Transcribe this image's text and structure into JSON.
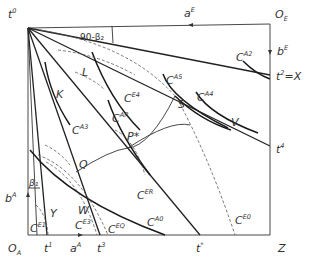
{
  "diagram": {
    "type": "edgeworth-box",
    "origins": {
      "bottom_left": "O_A",
      "top_right": "O_E"
    },
    "corner_labels": {
      "top_left": {
        "base": "t",
        "sup": "0"
      },
      "bottom_right": "Z",
      "right_mid": {
        "base": "t",
        "sup": "2",
        "suffix": "=X"
      }
    },
    "axis_labels": {
      "top_arrow": {
        "base": "a",
        "sup": "E"
      },
      "right_arrow": {
        "base": "b",
        "sup": "E"
      },
      "left_arrow": {
        "base": "b",
        "sup": "A"
      },
      "bottom_arrow": {
        "base": "a",
        "sup": "A"
      },
      "right_t4": {
        "base": "t",
        "sup": "4"
      }
    },
    "bottom_ticks": [
      {
        "base": "t",
        "sup": "1"
      },
      {
        "base": "a",
        "sup": "A"
      },
      {
        "base": "t",
        "sup": "3"
      },
      {
        "base": "t",
        "sup": "*"
      }
    ],
    "angles": {
      "top": "90-β₂",
      "left": "β₁"
    },
    "points": [
      "L",
      "K",
      "S",
      "V",
      "P*",
      "Q",
      "W",
      "Y"
    ],
    "curves": {
      "A_indifference": [
        {
          "base": "C",
          "sup": "A2"
        },
        {
          "base": "C",
          "sup": "A5"
        },
        {
          "base": "C",
          "sup": "A4"
        },
        {
          "base": "C",
          "sup": "A3"
        },
        {
          "base": "C",
          "sup": "AR"
        },
        {
          "base": "C",
          "sup": "A0"
        }
      ],
      "E_indifference": [
        {
          "base": "C",
          "sup": "E4"
        },
        {
          "base": "C",
          "sup": "ER"
        },
        {
          "base": "C",
          "sup": "E3"
        },
        {
          "base": "C",
          "sup": "EQ"
        },
        {
          "base": "C",
          "sup": "E1"
        },
        {
          "base": "C",
          "sup": "E0"
        }
      ]
    }
  }
}
